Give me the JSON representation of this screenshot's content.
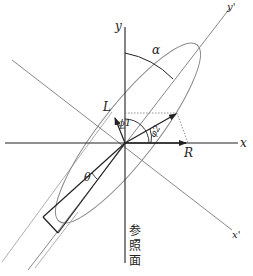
{
  "diagram": {
    "type": "polarization ellipse",
    "labels": {
      "x_axis": "x",
      "y_axis": "y",
      "x_prime_axis": "x'",
      "y_prime_axis": "y'",
      "alpha": "α",
      "theta": "θ",
      "phi1": "ϕ1",
      "phi2": "φ2",
      "L": "L",
      "R": "R",
      "reference_plane": [
        "参",
        "照",
        "面"
      ]
    },
    "colors": {
      "axis": "#222222",
      "rotated_axis": "#888888",
      "ellipse": "#888888",
      "vector": "#222222",
      "dotted": "#777777"
    }
  }
}
